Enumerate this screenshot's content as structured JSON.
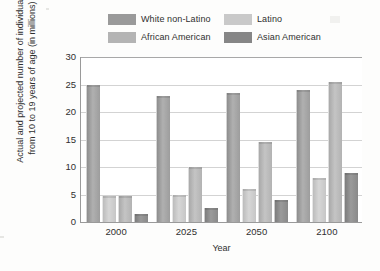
{
  "legend": {
    "items": [
      {
        "label": "White non-Latino",
        "color": "#9a9a9a",
        "key": "white_non_latino"
      },
      {
        "label": "Latino",
        "color": "#c9c9c9",
        "key": "latino"
      },
      {
        "label": "African American",
        "color": "#b4b4b4",
        "key": "african_american"
      },
      {
        "label": "Asian American",
        "color": "#868686",
        "key": "asian_american"
      }
    ]
  },
  "axes": {
    "y_title": "Actual and projected number of individuals from 10 to 19 years of age (in millions)",
    "y_ticks": [
      "30",
      "25",
      "20",
      "15",
      "10",
      "5",
      "0"
    ],
    "x_title": "Year",
    "x_ticks": [
      "2000",
      "2025",
      "2050",
      "2100"
    ]
  },
  "chart_data": {
    "type": "bar",
    "title": "",
    "subtitle": "",
    "xlabel": "Year",
    "ylabel": "Actual and projected number of individuals from 10 to 19 years of age (in millions)",
    "categories": [
      "2000",
      "2025",
      "2050",
      "2100"
    ],
    "ylim": [
      0,
      30
    ],
    "ytick_step": 5,
    "grid": true,
    "legend_position": "top",
    "series": [
      {
        "name": "White non-Latino",
        "color": "#9a9a9a",
        "values": [
          25,
          23,
          23.5,
          24
        ]
      },
      {
        "name": "Latino",
        "color": "#c9c9c9",
        "values": [
          4.7,
          5,
          6,
          8
        ]
      },
      {
        "name": "African American",
        "color": "#b4b4b4",
        "values": [
          4.7,
          10,
          14.5,
          25.5
        ]
      },
      {
        "name": "Asian American",
        "color": "#868686",
        "values": [
          1.5,
          2.5,
          4,
          9
        ]
      }
    ]
  }
}
